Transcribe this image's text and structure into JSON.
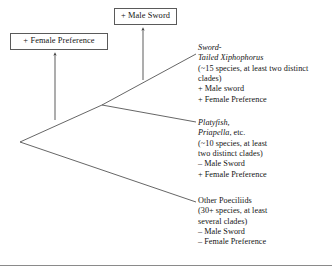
{
  "figure": {
    "type": "phylogenetic-tree",
    "background_color": "#ffffff",
    "line_color": "#4a4a4a",
    "text_color": "#141414"
  },
  "events": {
    "male_sword": {
      "label": "+ Male Sword",
      "arrow": "upward-arrow"
    },
    "female_preference": {
      "label": "+ Female Preference",
      "arrow": "upward-arrow"
    }
  },
  "taxa": [
    {
      "id": "sword-tailed-xiphophorus",
      "name_lines": [
        {
          "text": "Sword-",
          "style": "italic"
        },
        {
          "text": "Tailed Xiphophorus",
          "style": "italic"
        }
      ],
      "detail_lines": [
        "(~15 species, at least two distinct",
        "clades)",
        "+ Male sword",
        "+ Female Preference"
      ]
    },
    {
      "id": "platyfish-priapella",
      "name_lines": [
        {
          "text": "Platyfish,",
          "style": "italic"
        },
        {
          "text": "Priapella",
          "style": "italic",
          "suffix": ", etc."
        }
      ],
      "detail_lines": [
        "(~10 species, at least",
        "two distinct clades)",
        "– Male Sword",
        "+ Female Preference"
      ]
    },
    {
      "id": "other-poeciliids",
      "name_lines": [
        {
          "text": "Other Poeciliids",
          "style": "roman"
        }
      ],
      "detail_lines": [
        "(30+ species, at least",
        "several clades)",
        "– Male Sword",
        "– Female Preference"
      ]
    }
  ]
}
